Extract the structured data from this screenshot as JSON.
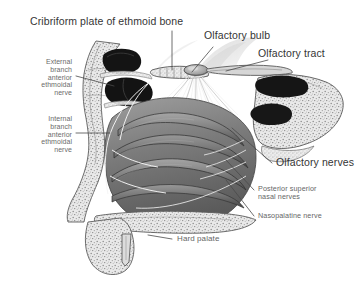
{
  "figure": {
    "background_color": "#ffffff",
    "width": 361,
    "height": 283
  },
  "colors": {
    "major_label": "#353535",
    "minor_label": "#6b6b6b",
    "leader_line": "#4a4a4a",
    "background": "#ffffff",
    "ink_dark": "#1c1c1c",
    "ink_mid": "#6e6e6e",
    "ink_light": "#b9b9b9"
  },
  "labels": {
    "cribriform_plate": "Cribriform plate of ethmoid bone",
    "olfactory_bulb": "Olfactory bulb",
    "olfactory_tract": "Olfactory tract",
    "external_branch": "External\nbranch\nanterior\nethmoidal\nnerve",
    "internal_branch": "Internal\nbranch\nanterior\nethmoidal\nnerve",
    "olfactory_nerves": "Olfactory nerves",
    "posterior_superior_nasal_nerves": "Posterior superior\nnasal nerves",
    "nasopalatine_nerve": "Nasopalatine nerve",
    "hard_palate": "Hard palate"
  },
  "structures": [
    {
      "name": "frontal-sinus",
      "note": "dark cavity upper left of section"
    },
    {
      "name": "ethmoid-air-cells",
      "note": "dark cavity below frontal sinus"
    },
    {
      "name": "cribriform-plate",
      "note": "perforated bony plate at roof of nasal cavity"
    },
    {
      "name": "olfactory-bulb",
      "note": "oval body above cribriform plate"
    },
    {
      "name": "olfactory-tract",
      "note": "band extending posteriorly from bulb"
    },
    {
      "name": "olfactory-nerve-filaments",
      "note": "fan of fine fibres descending from bulb"
    },
    {
      "name": "superior-nasal-concha",
      "note": "uppermost turbinate scroll"
    },
    {
      "name": "middle-nasal-concha",
      "note": "middle turbinate scroll"
    },
    {
      "name": "inferior-nasal-concha",
      "note": "lowest turbinate scroll"
    },
    {
      "name": "hard-palate",
      "note": "horizontal cancellous bone plate at floor"
    },
    {
      "name": "incisor-tooth",
      "note": "tooth root in anterior palate"
    },
    {
      "name": "sphenoid-body",
      "note": "cancellous bone mass at right"
    },
    {
      "name": "nasal-septum-mucosa",
      "note": "broad shaded wall of cavity"
    }
  ]
}
